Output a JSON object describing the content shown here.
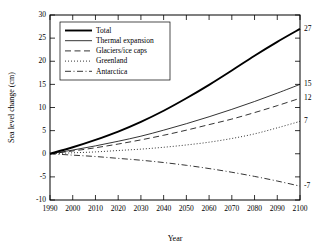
{
  "chart_data": {
    "type": "line",
    "title": "",
    "xlabel": "Year",
    "ylabel": "Sea level change (cm)",
    "xlim": [
      1990,
      2100
    ],
    "ylim": [
      -10,
      30
    ],
    "xticks": [
      1990,
      2000,
      2010,
      2020,
      2030,
      2040,
      2050,
      2060,
      2070,
      2080,
      2090,
      2100
    ],
    "yticks": [
      -10,
      -5,
      0,
      5,
      10,
      15,
      20,
      25,
      30
    ],
    "grid": false,
    "legend_position": "upper left",
    "x": [
      1990,
      2000,
      2010,
      2020,
      2030,
      2040,
      2050,
      2060,
      2070,
      2080,
      2090,
      2100
    ],
    "series": [
      {
        "name": "Total",
        "style": "solid-thick",
        "endpoint_label": "27",
        "values": [
          0,
          1.4,
          3.0,
          4.8,
          6.9,
          9.3,
          12.0,
          14.9,
          18.0,
          21.2,
          24.2,
          27.0
        ]
      },
      {
        "name": "Thermal expansion",
        "style": "solid-thin",
        "endpoint_label": "15",
        "values": [
          0,
          0.8,
          1.7,
          2.7,
          3.8,
          5.1,
          6.5,
          8.0,
          9.6,
          11.3,
          13.1,
          15.0
        ]
      },
      {
        "name": "Glaciers/ice caps",
        "style": "dashed",
        "endpoint_label": "12",
        "values": [
          0,
          0.6,
          1.3,
          2.1,
          3.0,
          4.0,
          5.1,
          6.3,
          7.5,
          8.9,
          10.4,
          12.0
        ]
      },
      {
        "name": "Greenland",
        "style": "dotted",
        "endpoint_label": "7",
        "values": [
          0,
          0.2,
          0.4,
          0.7,
          1.0,
          1.4,
          1.9,
          2.5,
          3.3,
          4.3,
          5.6,
          7.0
        ]
      },
      {
        "name": "Antarctica",
        "style": "dash-dot",
        "endpoint_label": "-7",
        "values": [
          0,
          -0.3,
          -0.6,
          -1.0,
          -1.4,
          -1.9,
          -2.5,
          -3.2,
          -4.0,
          -4.9,
          -5.9,
          -7.0
        ]
      }
    ]
  },
  "legend": {
    "items": [
      {
        "label": "Total"
      },
      {
        "label": "Thermal expansion"
      },
      {
        "label": "Glaciers/ice caps"
      },
      {
        "label": "Greenland"
      },
      {
        "label": "Antarctica"
      }
    ]
  }
}
